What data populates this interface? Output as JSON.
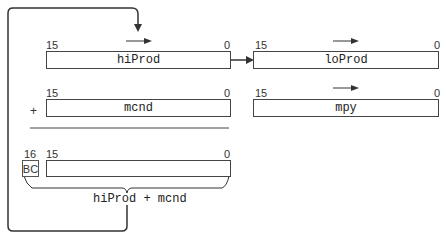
{
  "registers": {
    "hiProd": {
      "name": "hiProd",
      "msb": "15",
      "lsb": "0"
    },
    "loProd": {
      "name": "loProd",
      "msb": "15",
      "lsb": "0"
    },
    "mcnd": {
      "name": "mcnd",
      "msb": "15",
      "lsb": "0"
    },
    "mpy": {
      "name": "mpy",
      "msb": "15",
      "lsb": "0"
    },
    "sum": {
      "name": "",
      "msb": "15",
      "lsb": "0"
    }
  },
  "carry": {
    "label": "BC",
    "bit": "16"
  },
  "operator": "+",
  "sum_label": "hiProd + mcnd"
}
